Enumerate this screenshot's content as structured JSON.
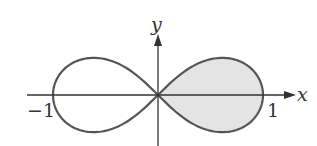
{
  "figure": {
    "type": "polar curve (lemniscate)",
    "equation_hint": "r^2 = cos 2θ",
    "axes": {
      "x_label": "x",
      "y_label": "y",
      "tick_labels": {
        "left": "−1",
        "right": "1"
      }
    },
    "shaded_region": "right loop",
    "colors": {
      "curve": "#555555",
      "axis": "#333333",
      "fill": "#e4e4e4"
    }
  }
}
